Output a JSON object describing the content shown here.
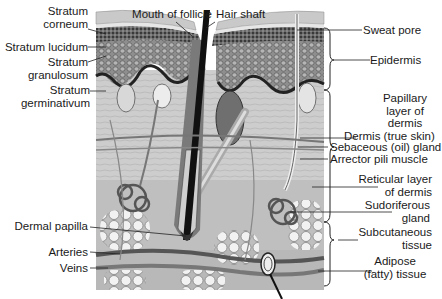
{
  "labels_left": {
    "stratum_corneum": [
      "Stratum",
      "corneum"
    ],
    "stratum_lucidum": "Stratum lucidum",
    "stratum_granulosum": [
      "Stratum",
      "granulosum"
    ],
    "stratum_germinativum": [
      "Stratum",
      "germinativum"
    ],
    "dermal_papilla": "Dermal papilla",
    "arteries": "Arteries",
    "veins": "Veins"
  },
  "labels_top": {
    "mouth_of_follicle": "Mouth of follicle",
    "hair_shaft": "Hair shaft"
  },
  "labels_right": {
    "sweat_pore": "Sweat pore",
    "epidermis": "Epidermis",
    "papillary_layer": [
      "Papillary",
      "layer of",
      "dermis"
    ],
    "dermis": "Dermis (true skin)",
    "sebaceous_gland": "Sebaceous (oil) gland",
    "arrector_pili": "Arrector pili muscle",
    "reticular_layer": [
      "Reticular layer",
      "of dermis"
    ],
    "sudoriferous_gland": [
      "Sudoriferous",
      "gland"
    ],
    "subcutaneous": [
      "Subcutaneous",
      "tissue"
    ],
    "adipose": [
      "Adipose",
      "(fatty) tissue"
    ]
  },
  "colors": {
    "ink": "#1a1a1a",
    "corneum": "#c9c9c9",
    "granulosum": "#5a5a5a",
    "germinativum": "#9a9a9a",
    "dermis": "#cfcfcf",
    "subcutaneous": "#bdbdbd",
    "fat": "#eeeeee"
  }
}
